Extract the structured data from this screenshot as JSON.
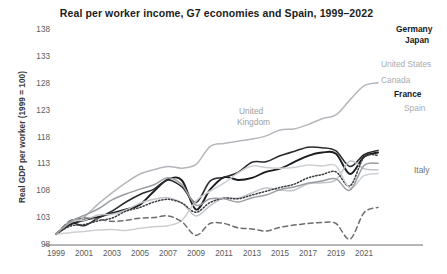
{
  "chart_data": {
    "type": "line",
    "title": "Real per worker income, G7 economies and Spain, 1999–2022",
    "xlabel": "",
    "ylabel": "Real GDP per worker (1999 = 100)",
    "xlim": [
      1999,
      2022
    ],
    "ylim": [
      98,
      138
    ],
    "yticks": [
      98,
      103,
      108,
      113,
      118,
      123,
      128,
      133,
      138
    ],
    "xticks": [
      1999,
      2001,
      2003,
      2005,
      2007,
      2009,
      2011,
      2013,
      2015,
      2017,
      2019,
      2021
    ],
    "grid": false,
    "legend_position": "right-inline",
    "x": [
      1999,
      2000,
      2001,
      2002,
      2003,
      2004,
      2005,
      2006,
      2007,
      2008,
      2009,
      2010,
      2011,
      2012,
      2013,
      2014,
      2015,
      2016,
      2017,
      2018,
      2019,
      2020,
      2021,
      2022
    ],
    "series": [
      {
        "name": "Germany",
        "label": "Germany",
        "color": "#1b1c1e",
        "style": "solid",
        "width": 1.9,
        "values": [
          100.0,
          101.8,
          102.6,
          103.2,
          103.9,
          104.6,
          105.5,
          108.0,
          110.2,
          110.0,
          104.6,
          108.3,
          110.6,
          110.1,
          110.5,
          111.6,
          112.2,
          113.4,
          114.6,
          115.2,
          115.0,
          111.2,
          114.4,
          115.2
        ]
      },
      {
        "name": "Japan",
        "label": "Japan",
        "color": "#2a2b2e",
        "style": "solid",
        "width": 1.6,
        "values": [
          100.0,
          102.1,
          101.6,
          103.0,
          104.3,
          106.0,
          107.4,
          108.4,
          110.1,
          108.8,
          105.9,
          109.9,
          110.6,
          111.5,
          113.4,
          113.5,
          114.6,
          115.4,
          116.2,
          116.1,
          115.5,
          112.6,
          114.8,
          115.6
        ]
      },
      {
        "name": "United States",
        "label": "United States",
        "color": "#b4b7bb",
        "style": "solid",
        "width": 1.5,
        "values": [
          100.0,
          102.1,
          103.2,
          105.6,
          107.7,
          109.6,
          111.2,
          112.0,
          112.6,
          112.3,
          113.0,
          116.3,
          116.9,
          117.3,
          117.7,
          118.3,
          119.4,
          119.6,
          120.4,
          121.5,
          122.2,
          125.0,
          127.6,
          128.2
        ]
      },
      {
        "name": "Canada",
        "label": "Canada",
        "color": "#c2c5c9",
        "style": "solid",
        "width": 1.5,
        "values": [
          100.0,
          102.4,
          102.6,
          103.6,
          103.7,
          104.5,
          105.8,
          106.5,
          106.8,
          105.8,
          103.4,
          105.3,
          106.8,
          106.7,
          107.7,
          108.6,
          108.2,
          108.2,
          109.4,
          109.6,
          110.1,
          113.6,
          112.2,
          112.0
        ]
      },
      {
        "name": "France",
        "label": "France",
        "color": "#3c3d40",
        "style": "dotted",
        "width": 1.5,
        "values": [
          100.0,
          101.5,
          101.8,
          102.5,
          103.0,
          104.3,
          105.0,
          106.0,
          106.5,
          105.8,
          104.1,
          105.9,
          106.7,
          106.6,
          107.3,
          108.0,
          108.7,
          109.3,
          110.5,
          111.1,
          111.6,
          109.0,
          114.3,
          114.7
        ]
      },
      {
        "name": "Spain",
        "label": "Spain",
        "color": "#cdd0d3",
        "style": "solid",
        "width": 1.5,
        "values": [
          100.0,
          100.3,
          100.5,
          100.8,
          100.9,
          100.7,
          101.1,
          101.4,
          101.6,
          102.6,
          106.2,
          108.0,
          109.5,
          111.4,
          112.7,
          112.4,
          112.3,
          112.4,
          112.9,
          112.7,
          112.7,
          108.6,
          110.9,
          111.3
        ]
      },
      {
        "name": "Italy",
        "label": "Italy",
        "color": "#6b6d70",
        "style": "dashed",
        "width": 1.5,
        "values": [
          100.0,
          102.5,
          103.0,
          102.8,
          102.4,
          102.6,
          103.0,
          103.1,
          103.4,
          102.3,
          99.8,
          102.0,
          102.0,
          101.2,
          101.0,
          100.6,
          101.3,
          101.7,
          102.0,
          102.2,
          102.0,
          99.1,
          104.0,
          105.0
        ]
      },
      {
        "name": "United Kingdom",
        "label": "United Kingdom",
        "color": "#9a9da1",
        "style": "solid",
        "width": 1.5,
        "values": [
          100.0,
          102.3,
          103.5,
          104.7,
          106.4,
          107.5,
          108.4,
          109.2,
          110.5,
          109.2,
          105.4,
          106.6,
          106.6,
          106.0,
          106.8,
          107.3,
          108.3,
          108.8,
          109.5,
          109.9,
          110.3,
          108.2,
          112.8,
          113.2
        ]
      }
    ],
    "annotations": [
      {
        "text": "United Kingdom",
        "style": "inline",
        "x": 2012,
        "y": 121.5
      }
    ]
  },
  "labels": {
    "germany": "Germany",
    "japan": "Japan",
    "united_states": "United States",
    "canada": "Canada",
    "france": "France",
    "spain": "Spain",
    "italy": "Italy",
    "united_kingdom_line1": "United",
    "united_kingdom_line2": "Kingdom"
  }
}
